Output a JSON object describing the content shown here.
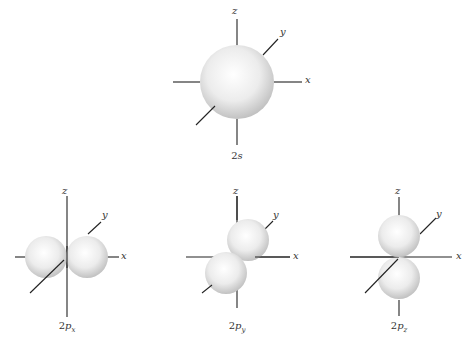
{
  "figure": {
    "orbitals": [
      {
        "id": "2s",
        "caption_main": "2",
        "caption_italic": "s",
        "caption_sub": "",
        "axes": {
          "x": "x",
          "y": "y",
          "z": "z"
        }
      },
      {
        "id": "2px",
        "caption_main": "2",
        "caption_italic": "p",
        "caption_sub": "x",
        "axes": {
          "x": "x",
          "y": "y",
          "z": "z"
        }
      },
      {
        "id": "2py",
        "caption_main": "2",
        "caption_italic": "p",
        "caption_sub": "y",
        "axes": {
          "x": "x",
          "y": "y",
          "z": "z"
        }
      },
      {
        "id": "2pz",
        "caption_main": "2",
        "caption_italic": "p",
        "caption_sub": "z",
        "axes": {
          "x": "x",
          "y": "y",
          "z": "z"
        }
      }
    ],
    "colors": {
      "axis": "#222222",
      "sphere_light": "#ffffff",
      "sphere_dark": "#bdbdbd"
    }
  }
}
